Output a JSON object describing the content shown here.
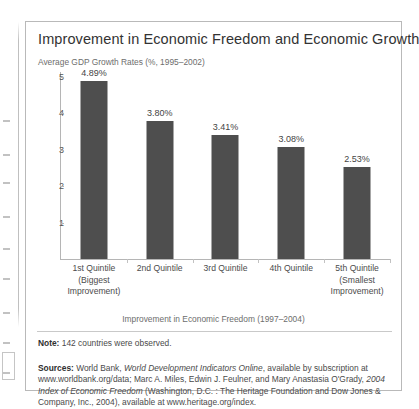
{
  "figure": {
    "title": "Improvement in Economic Freedom and Economic Growth",
    "note_label": "Note:",
    "note_text": "142 countries were observed.",
    "sources_label": "Sources:",
    "sources_parts": [
      {
        "text": "World Bank, ",
        "style": "normal"
      },
      {
        "text": "World Development Indicators Online",
        "style": "italic"
      },
      {
        "text": ", available by subscription at www.worldbank.org/data; Marc A. Miles, Edwin J. Feulner, and Mary Anastasia O'Grady, ",
        "style": "normal"
      },
      {
        "text": "2004 Index of Economic Freedom",
        "style": "italic"
      },
      {
        "text": " (Washington, D.C. : The Heritage Foundation and Dow Jones & Company, Inc., 2004), available at www.heritage.org/index.",
        "style": "normal"
      }
    ],
    "sources_plain": "World Bank, World Development Indicators Online, available by subscription at www.worldbank.org/data; Marc A. Miles, Edwin J. Feulner, and Mary Anastasia O'Grady, 2004 Index of Economic Freedom (Washington, D.C. : The Heritage Foundation and Dow Jones & Company, Inc., 2004), available at www.heritage.org/index."
  },
  "chart_data": {
    "type": "bar",
    "title": "Improvement in Economic Freedom and Economic Growth",
    "ylabel": "Average GDP Growth Rates (%, 1995–2002)",
    "xlabel": "Improvement in Economic Freedom (1997–2004)",
    "categories": [
      "1st Quintile\n(Biggest\nImprovement)",
      "2nd Quintile",
      "3rd Quintile",
      "4th Quintile",
      "5th Quintile\n(Smallest\nImprovement)"
    ],
    "category_lines": [
      [
        "1st Quintile",
        "(Biggest",
        "Improvement)"
      ],
      [
        "2nd Quintile",
        "",
        ""
      ],
      [
        "3rd Quintile",
        "",
        ""
      ],
      [
        "4th Quintile",
        "",
        ""
      ],
      [
        "5th Quintile",
        "(Smallest",
        "Improvement)"
      ]
    ],
    "values": [
      4.89,
      3.8,
      3.41,
      3.08,
      2.53
    ],
    "data_labels": [
      "4.89%",
      "3.80%",
      "3.41%",
      "3.08%",
      "2.53%"
    ],
    "ylim": [
      0,
      5
    ],
    "yticks": [
      1,
      2,
      3,
      4,
      5
    ],
    "ytick_labels": [
      "1",
      "2",
      "3",
      "4",
      "5"
    ],
    "grid": false,
    "legend": "none",
    "bar_color": "#4e4e4e"
  }
}
